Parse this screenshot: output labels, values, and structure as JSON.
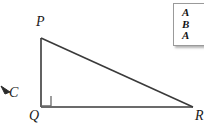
{
  "figure": {
    "type": "right-triangle-diagram",
    "stroke_color": "#3a3a3a",
    "background_color": "#ffffff",
    "vertices": [
      {
        "name": "P",
        "label": "P",
        "x": 41,
        "y": 38
      },
      {
        "name": "Q",
        "label": "Q",
        "x": 41,
        "y": 107
      },
      {
        "name": "R",
        "label": "R",
        "x": 193,
        "y": 107
      }
    ],
    "right_angle": {
      "at": "Q",
      "marker_size": 10
    },
    "edges": [
      {
        "from": "P",
        "to": "Q"
      },
      {
        "from": "Q",
        "to": "R"
      },
      {
        "from": "P",
        "to": "R"
      }
    ]
  },
  "annotation": {
    "label": "C",
    "arrow": "arrow-up-left"
  },
  "panel": {
    "lines": [
      "A",
      "B",
      "A"
    ],
    "border_color": "#9a9a9a",
    "background_color": "#ffffff"
  }
}
